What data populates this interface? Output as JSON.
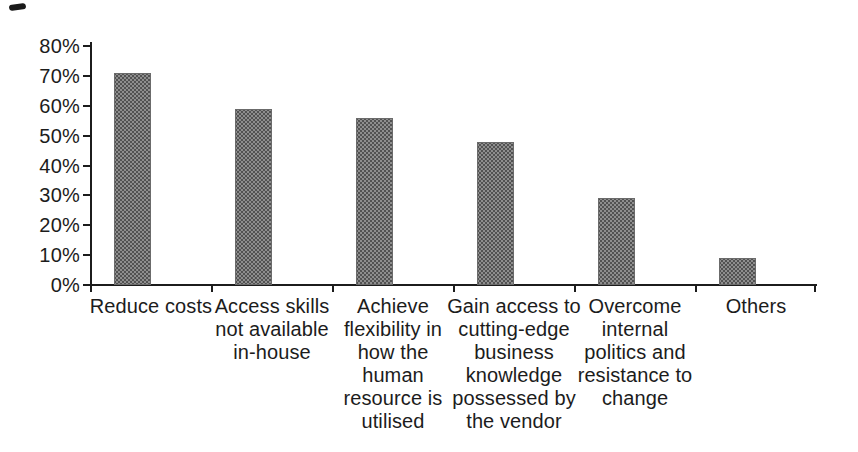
{
  "chart_data": {
    "type": "bar",
    "title": "",
    "xlabel": "",
    "ylabel": "",
    "categories": [
      "Reduce costs",
      "Access skills not available in-house",
      "Achieve flexibility in how the human resource is utilised",
      "Gain access to cutting-edge business knowledge possessed by the vendor",
      "Overcome internal politics and resistance to change",
      "Others"
    ],
    "wrapped_labels": [
      "Reduce costs",
      "Access skills\nnot available\nin-house",
      "Achieve\nflexibility in\nhow the\nhuman\nresource is\nutilised",
      "Gain access to\ncutting-edge\nbusiness\nknowledge\npossessed by\nthe vendor",
      "Overcome\ninternal\npolitics and\nresistance to\nchange",
      "Others"
    ],
    "values": [
      71,
      59,
      56,
      48,
      29,
      9
    ],
    "unit": "%",
    "ylim": [
      0,
      80
    ],
    "yticks": [
      0,
      10,
      20,
      30,
      40,
      50,
      60,
      70,
      80
    ],
    "ytick_labels": [
      "0%",
      "10%",
      "20%",
      "30%",
      "40%",
      "50%",
      "60%",
      "70%",
      "80%"
    ],
    "grid": false,
    "legend": false,
    "style": {
      "background": "#ffffff",
      "bar_fill": "#8e8e8e",
      "bar_dot": "#525252",
      "bar_border": "#6b6b6b",
      "axis_color": "#1c1c1c",
      "text_color": "#1c1c1c"
    }
  }
}
